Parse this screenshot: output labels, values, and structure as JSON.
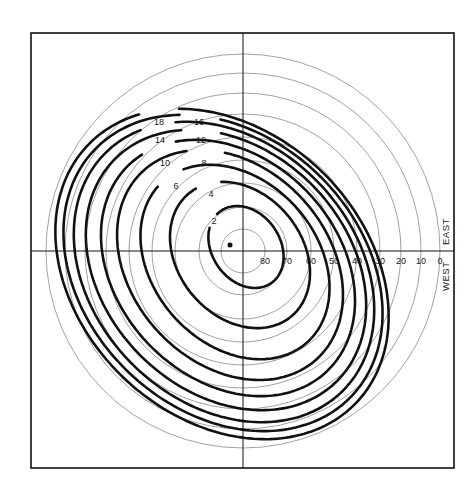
{
  "diagram": {
    "type": "polar-contour-diagram",
    "frame": {
      "x": 31,
      "y": 33,
      "width": 423,
      "height": 435
    },
    "center": {
      "x": 243,
      "y": 251
    },
    "colors": {
      "ink": "#111111",
      "thin": "#8a8a8a",
      "background": "#ffffff"
    },
    "direction_labels": {
      "east": "EAST",
      "west": "WEST"
    },
    "altitude_circles": [
      {
        "label": "80",
        "r": 22
      },
      {
        "label": "70",
        "r": 44
      },
      {
        "label": "60",
        "r": 68
      },
      {
        "label": "50",
        "r": 91
      },
      {
        "label": "40",
        "r": 114
      },
      {
        "label": "30",
        "r": 137
      },
      {
        "label": "20",
        "r": 158
      },
      {
        "label": "10",
        "r": 178
      },
      {
        "label": "0",
        "r": 197
      }
    ],
    "contours": [
      {
        "label": "2",
        "cx": 246,
        "cy": 247,
        "rx": 34,
        "ry": 44,
        "rot": -35,
        "lx": 214,
        "ly": 221
      },
      {
        "label": "4",
        "cx": 240,
        "cy": 255,
        "rx": 62,
        "ry": 80,
        "rot": -40,
        "lx": 211,
        "ly": 194
      },
      {
        "label": "6",
        "cx": 235,
        "cy": 262,
        "rx": 82,
        "ry": 108,
        "rot": -42,
        "lx": 176,
        "ly": 186
      },
      {
        "label": "8",
        "cx": 230,
        "cy": 265,
        "rx": 98,
        "ry": 128,
        "rot": -43,
        "lx": 204,
        "ly": 163
      },
      {
        "label": "10",
        "cx": 228,
        "cy": 268,
        "rx": 110,
        "ry": 143,
        "rot": -44,
        "lx": 165,
        "ly": 163
      },
      {
        "label": "12",
        "cx": 226,
        "cy": 270,
        "rx": 121,
        "ry": 157,
        "rot": -45,
        "lx": 201,
        "ly": 140
      },
      {
        "label": "14",
        "cx": 224,
        "cy": 272,
        "rx": 130,
        "ry": 168,
        "rot": -45,
        "lx": 160,
        "ly": 140
      },
      {
        "label": "16",
        "cx": 223,
        "cy": 273,
        "rx": 137,
        "ry": 178,
        "rot": -46,
        "lx": 199,
        "ly": 122
      },
      {
        "label": "18",
        "cx": 222,
        "cy": 274,
        "rx": 143,
        "ry": 186,
        "rot": -46,
        "lx": 159,
        "ly": 122
      }
    ],
    "sun_point": {
      "x": 230,
      "y": 245,
      "r": 2.5
    }
  }
}
